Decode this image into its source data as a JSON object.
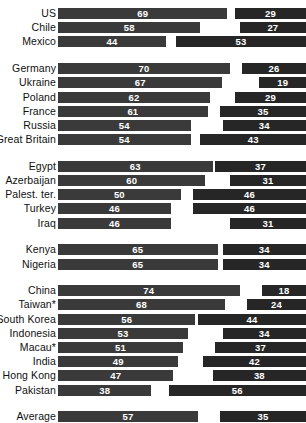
{
  "chart_data": {
    "type": "bar",
    "title": "",
    "subtitle": "",
    "xlabel": "",
    "ylabel": "",
    "orientation": "horizontal-paired",
    "legend": [],
    "axis_range": [
      0,
      100
    ],
    "grid": false,
    "colors": {
      "left_series": "#3a3a3a",
      "right_series": "#262626",
      "background": "#ffffff",
      "label_text": "#101010",
      "value_text": "#ffffff"
    },
    "series": [
      {
        "name": "left",
        "values": [
          69,
          58,
          44,
          70,
          67,
          62,
          61,
          54,
          54,
          63,
          60,
          50,
          46,
          46,
          65,
          65,
          74,
          68,
          56,
          53,
          51,
          49,
          47,
          38,
          57
        ]
      },
      {
        "name": "right",
        "values": [
          29,
          27,
          53,
          26,
          19,
          29,
          35,
          34,
          43,
          37,
          31,
          46,
          46,
          31,
          34,
          34,
          18,
          24,
          44,
          34,
          37,
          42,
          38,
          56,
          35
        ]
      }
    ],
    "categories": [
      "US",
      "Chile",
      "Mexico",
      "Germany",
      "Ukraine",
      "Poland",
      "France",
      "Russia",
      "Great Britain",
      "Egypt",
      "Azerbaijan",
      "Palest. ter.",
      "Turkey",
      "Iraq",
      "Kenya",
      "Nigeria",
      "China",
      "Taiwan*",
      "South Korea",
      "Indonesia",
      "Macau*",
      "India",
      "Hong Kong",
      "Pakistan",
      "Average"
    ],
    "groups": [
      {
        "name": "americas",
        "rows": [
          {
            "label": "US",
            "left": 69,
            "right": 29
          },
          {
            "label": "Chile",
            "left": 58,
            "right": 27
          },
          {
            "label": "Mexico",
            "left": 44,
            "right": 53
          }
        ]
      },
      {
        "name": "europe",
        "rows": [
          {
            "label": "Germany",
            "left": 70,
            "right": 26
          },
          {
            "label": "Ukraine",
            "left": 67,
            "right": 19
          },
          {
            "label": "Poland",
            "left": 62,
            "right": 29
          },
          {
            "label": "France",
            "left": 61,
            "right": 35
          },
          {
            "label": "Russia",
            "left": 54,
            "right": 34
          },
          {
            "label": "Great Britain",
            "left": 54,
            "right": 43
          }
        ]
      },
      {
        "name": "middle-east",
        "rows": [
          {
            "label": "Egypt",
            "left": 63,
            "right": 37
          },
          {
            "label": "Azerbaijan",
            "left": 60,
            "right": 31
          },
          {
            "label": "Palest. ter.",
            "left": 50,
            "right": 46
          },
          {
            "label": "Turkey",
            "left": 46,
            "right": 46
          },
          {
            "label": "Iraq",
            "left": 46,
            "right": 31
          }
        ]
      },
      {
        "name": "africa",
        "rows": [
          {
            "label": "Kenya",
            "left": 65,
            "right": 34
          },
          {
            "label": "Nigeria",
            "left": 65,
            "right": 34
          }
        ]
      },
      {
        "name": "asia",
        "rows": [
          {
            "label": "China",
            "left": 74,
            "right": 18
          },
          {
            "label": "Taiwan*",
            "left": 68,
            "right": 24
          },
          {
            "label": "South Korea",
            "left": 56,
            "right": 44
          },
          {
            "label": "Indonesia",
            "left": 53,
            "right": 34
          },
          {
            "label": "Macau*",
            "left": 51,
            "right": 37
          },
          {
            "label": "India",
            "left": 49,
            "right": 42
          },
          {
            "label": "Hong Kong",
            "left": 47,
            "right": 38
          },
          {
            "label": "Pakistan",
            "left": 38,
            "right": 56
          }
        ]
      },
      {
        "name": "average",
        "rows": [
          {
            "label": "Average",
            "left": 57,
            "right": 35
          }
        ]
      }
    ]
  }
}
